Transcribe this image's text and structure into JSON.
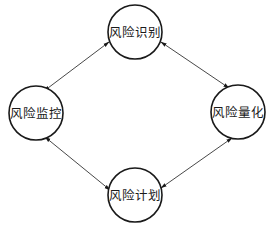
{
  "diagram": {
    "type": "cycle",
    "nodes": [
      {
        "id": "identify",
        "label": "风险识别",
        "cx": 135,
        "cy": 32,
        "r": 27
      },
      {
        "id": "quantify",
        "label": "风险量化",
        "cx": 238,
        "cy": 112,
        "r": 27
      },
      {
        "id": "plan",
        "label": "风险计划",
        "cx": 135,
        "cy": 195,
        "r": 27
      },
      {
        "id": "monitor",
        "label": "风险监控",
        "cx": 36,
        "cy": 113,
        "r": 27
      }
    ],
    "edges": [
      {
        "from": "identify",
        "to": "monitor",
        "direction": "both"
      },
      {
        "from": "identify",
        "to": "quantify",
        "direction": "both"
      },
      {
        "from": "monitor",
        "to": "plan",
        "direction": "both"
      },
      {
        "from": "plan",
        "to": "quantify",
        "direction": "both"
      }
    ],
    "colors": {
      "stroke": "#1a1a1a",
      "background": "#ffffff"
    }
  }
}
